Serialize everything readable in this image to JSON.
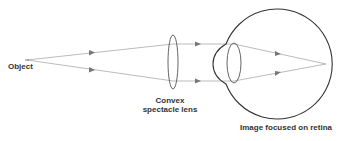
{
  "diagram": {
    "type": "optics-ray-diagram",
    "labels": {
      "object": "Object",
      "lens_line1": "Convex",
      "lens_line2": "spectacle lens",
      "retina": "Image focused on retina"
    },
    "colors": {
      "ray": "#aaaaaa",
      "outline": "#444444",
      "text": "#333333",
      "arrow": "#777777"
    }
  }
}
